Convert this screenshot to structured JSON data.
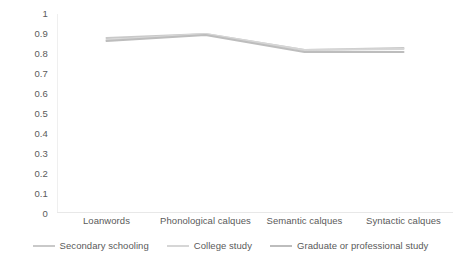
{
  "chart_data": {
    "type": "line",
    "title": "",
    "xlabel": "",
    "ylabel": "",
    "categories": [
      "Loanwords",
      "Phonological calques",
      "Semantic calques",
      "Syntactic calques"
    ],
    "series": [
      {
        "name": "Secondary schooling",
        "color": "#c9c9c9",
        "values": [
          0.88,
          0.9,
          0.82,
          0.83
        ]
      },
      {
        "name": "College study",
        "color": "#d6d6d6",
        "values": [
          0.87,
          0.9,
          0.82,
          0.825
        ]
      },
      {
        "name": "Graduate or professional study",
        "color": "#bdbdbd",
        "values": [
          0.865,
          0.895,
          0.81,
          0.81
        ]
      }
    ],
    "ylim": [
      0,
      1
    ],
    "ytick_values": [
      1,
      0.9,
      0.8,
      0.7,
      0.6,
      0.5,
      0.4,
      0.3,
      0.2,
      0.1,
      0
    ],
    "ytick_labels": [
      "1",
      "0.9",
      "0.8",
      "0.7",
      "0.6",
      "0.5",
      "0.4",
      "0.3",
      "0.2",
      "0.1",
      "0"
    ],
    "grid": false,
    "legend_position": "bottom"
  },
  "axis": {
    "y_ticks": [
      {
        "label": "1",
        "value": 1
      },
      {
        "label": "0.9",
        "value": 0.9
      },
      {
        "label": "0.8",
        "value": 0.8
      },
      {
        "label": "0.7",
        "value": 0.7
      },
      {
        "label": "0.6",
        "value": 0.6
      },
      {
        "label": "0.5",
        "value": 0.5
      },
      {
        "label": "0.4",
        "value": 0.4
      },
      {
        "label": "0.3",
        "value": 0.3
      },
      {
        "label": "0.2",
        "value": 0.2
      },
      {
        "label": "0.1",
        "value": 0.1
      },
      {
        "label": "0",
        "value": 0
      }
    ],
    "x_ticks": [
      {
        "label": "Loanwords"
      },
      {
        "label": "Phonological calques"
      },
      {
        "label": "Semantic calques"
      },
      {
        "label": "Syntactic calques"
      }
    ]
  },
  "legend": {
    "items": [
      {
        "label": "Secondary schooling",
        "color": "#c9c9c9"
      },
      {
        "label": "College study",
        "color": "#d6d6d6"
      },
      {
        "label": "Graduate or professional study",
        "color": "#bdbdbd"
      }
    ]
  }
}
